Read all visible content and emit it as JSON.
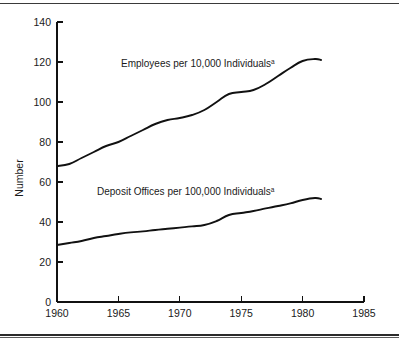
{
  "chart_data": {
    "type": "line",
    "title": "",
    "xlabel": "",
    "ylabel": "Number",
    "xlim": [
      1960,
      1985
    ],
    "ylim": [
      0,
      140
    ],
    "xticks": [
      1960,
      1965,
      1970,
      1975,
      1980,
      1985
    ],
    "yticks": [
      0,
      20,
      40,
      60,
      80,
      100,
      120,
      140
    ],
    "xtick_labels": [
      "1960",
      "1965",
      "1970",
      "1975",
      "1980",
      "1985"
    ],
    "ytick_labels": [
      "0",
      "20",
      "40",
      "60",
      "80",
      "100",
      "120",
      "140"
    ],
    "grid": false,
    "legend": "inline-annotations",
    "footnote_marker": "a",
    "series": [
      {
        "name": "Employees per 10,000 Individuals",
        "label_text": "Employees per 10,000 Individuals",
        "label_marker": "a",
        "x": [
          1960,
          1961,
          1962,
          1963,
          1964,
          1965,
          1966,
          1967,
          1968,
          1969,
          1970,
          1971,
          1972,
          1973,
          1974,
          1975,
          1976,
          1977,
          1978,
          1979,
          1980,
          1981,
          1981.5
        ],
        "values": [
          68,
          69,
          72,
          75,
          78,
          80,
          83,
          86,
          89,
          91,
          92,
          93.5,
          96,
          100,
          104,
          105,
          106,
          109,
          113,
          117,
          120.5,
          121.5,
          121
        ]
      },
      {
        "name": "Deposit Offices per 100,000 Individuals",
        "label_text": "Deposit Offices per 100,000 Individuals",
        "label_marker": "a",
        "x": [
          1960,
          1961,
          1962,
          1963,
          1964,
          1965,
          1966,
          1967,
          1968,
          1969,
          1970,
          1971,
          1972,
          1973,
          1974,
          1975,
          1976,
          1977,
          1978,
          1979,
          1980,
          1981,
          1981.5
        ],
        "values": [
          28.5,
          29.5,
          30.5,
          32,
          33,
          34,
          34.8,
          35.3,
          36,
          36.6,
          37.2,
          37.8,
          38.5,
          40.5,
          43.5,
          44.5,
          45.5,
          46.8,
          48,
          49.3,
          51,
          52,
          51.5
        ]
      }
    ],
    "colors": {
      "line": "#111111",
      "axis": "#111111",
      "text": "#1a1a1a",
      "background": "#ffffff"
    }
  },
  "annotations": {
    "upper_label": "Employees per 10,000 Individuals",
    "upper_label_marker": "a",
    "lower_label": "Deposit Offices per 100,000 Individuals",
    "lower_label_marker": "a"
  },
  "axis": {
    "y_title": "Number"
  }
}
